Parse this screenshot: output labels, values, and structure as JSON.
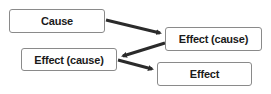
{
  "diagram": {
    "nodes": [
      {
        "id": "cause",
        "label": "Cause"
      },
      {
        "id": "effect-cause-1",
        "label": "Effect (cause)"
      },
      {
        "id": "effect-cause-2",
        "label": "Effect (cause)"
      },
      {
        "id": "effect",
        "label": "Effect"
      }
    ],
    "edges": [
      {
        "from": "cause",
        "to": "effect-cause-1"
      },
      {
        "from": "effect-cause-1",
        "to": "effect-cause-2"
      },
      {
        "from": "effect-cause-2",
        "to": "effect"
      }
    ],
    "colors": {
      "arrow": "#2b2b2b",
      "border": "#8a8a8a",
      "text": "#1a1a1a"
    }
  }
}
